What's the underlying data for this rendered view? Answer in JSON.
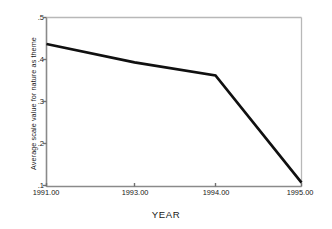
{
  "chart_data": {
    "type": "line",
    "title": "",
    "xlabel": "YEAR",
    "ylabel": "Average scale value for nature as theme",
    "x": [
      1991,
      1993,
      1994,
      1995
    ],
    "xtick_labels": [
      "1991.00",
      "1993.00",
      "1994.00",
      "1995.00"
    ],
    "values": [
      0.437,
      0.393,
      0.362,
      0.107
    ],
    "ytick_labels": [
      ".5",
      ".4",
      ".3",
      ".2",
      ".1"
    ],
    "ytick_values": [
      0.5,
      0.4,
      0.3,
      0.2,
      0.1
    ],
    "xlim": [
      1991,
      1995
    ],
    "ylim": [
      0.1,
      0.5
    ],
    "grid": false,
    "legend": false,
    "series": [
      {
        "name": "Average scale value for nature as theme",
        "values": [
          0.437,
          0.393,
          0.362,
          0.107
        ],
        "color": "#101010"
      }
    ],
    "line_color": "#101010",
    "axis_color": "#808080",
    "background_color": "#ffffff"
  }
}
